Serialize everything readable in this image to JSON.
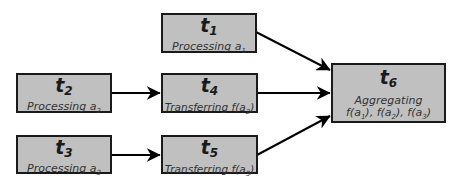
{
  "nodes": [
    {
      "id": "t1",
      "label": "t",
      "index": "1",
      "desc": "Processing a",
      "desc_sub": "1"
    },
    {
      "id": "t2",
      "label": "t",
      "index": "2",
      "desc": "Processing a",
      "desc_sub": "2"
    },
    {
      "id": "t3",
      "label": "t",
      "index": "3",
      "desc": "Processing a",
      "desc_sub": "3"
    },
    {
      "id": "t4",
      "label": "t",
      "index": "4",
      "desc": "Transferring f(a",
      "desc_sub": "2",
      "desc_end": ")"
    },
    {
      "id": "t5",
      "label": "t",
      "index": "5",
      "desc": "Transferring f(a",
      "desc_sub": "3",
      "desc_end": ")"
    },
    {
      "id": "t6",
      "label": "t",
      "index": "6",
      "desc": "Aggregating",
      "desc_line2": [
        "f(a",
        "1",
        "), f(a",
        "2",
        "), f(a",
        "3",
        ")"
      ]
    }
  ],
  "edges": [
    {
      "from": "t2",
      "to": "t4"
    },
    {
      "from": "t3",
      "to": "t5"
    },
    {
      "from": "t1",
      "to": "t6"
    },
    {
      "from": "t4",
      "to": "t6"
    },
    {
      "from": "t5",
      "to": "t6"
    }
  ],
  "colors": {
    "box_fill": "#c0c0c0",
    "border": "#1a1a1a",
    "arrow": "#000000"
  }
}
